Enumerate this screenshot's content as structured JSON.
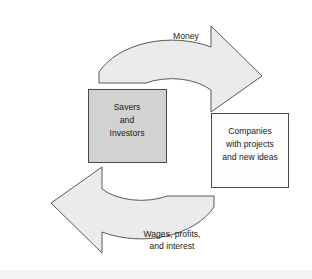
{
  "diagram": {
    "type": "circular-flow",
    "colors": {
      "arrow_fill": "#ebebeb",
      "arrow_stroke": "#5a5a5a",
      "savers_box_fill": "#d2d2d2",
      "companies_box_fill": "#fdfdfd",
      "box_stroke": "#4a4a4a",
      "text": "#1a1a1a",
      "background": "#ffffff"
    },
    "nodes": {
      "savers": {
        "id": "savers-and-investors",
        "lines": [
          "Savers",
          "and",
          "Investors"
        ],
        "line1": "Savers",
        "line2": "and",
        "line3": "Investors",
        "fill": "filled"
      },
      "companies": {
        "id": "companies-with-projects",
        "lines": [
          "Companies",
          "with projects",
          "and new ideas"
        ],
        "line1": "Companies",
        "line2": "with projects",
        "line3": "and new ideas",
        "fill": "plain"
      }
    },
    "flows": {
      "top": {
        "id": "money-flow",
        "label": "Money",
        "from": "savers",
        "to": "companies",
        "direction": "clockwise-top"
      },
      "bottom": {
        "id": "returns-flow",
        "lines": [
          "Wages, profits,",
          "and interest"
        ],
        "line1": "Wages, profits,",
        "line2": "and interest",
        "from": "companies",
        "to": "savers",
        "direction": "clockwise-bottom"
      }
    }
  }
}
